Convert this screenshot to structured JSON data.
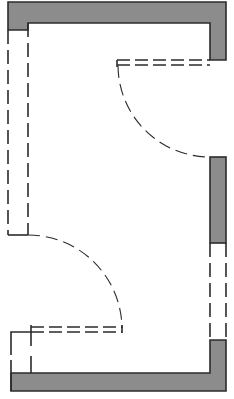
{
  "diagram": {
    "type": "floor-plan",
    "width": 234,
    "height": 399,
    "colors": {
      "background": "#ffffff",
      "wall_fill": "#8c8c8c",
      "line": "#2b2b2b"
    },
    "elements": {
      "walls": [
        "top-wall",
        "right-wall-upper",
        "right-wall-middle",
        "right-wall-lower",
        "bottom-wall"
      ],
      "openings": [
        "left-wall-opening",
        "right-wall-window"
      ],
      "doors": [
        {
          "name": "upper-right-door",
          "swing": "quarter-arc",
          "leaf": "double-dashed"
        },
        {
          "name": "lower-left-door",
          "swing": "quarter-arc",
          "leaf": "double-dashed"
        }
      ]
    }
  }
}
